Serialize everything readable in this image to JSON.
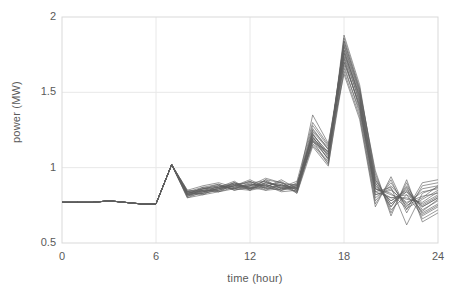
{
  "chart_data": {
    "type": "line",
    "title": "",
    "subtitle": "",
    "xlabel": "time (hour)",
    "ylabel": "power (MW)",
    "xlim": [
      0,
      24
    ],
    "ylim": [
      0.5,
      2
    ],
    "xticks": [
      "0",
      "6",
      "12",
      "18",
      "24"
    ],
    "xtick_values": [
      0,
      6,
      12,
      18,
      24
    ],
    "yticks": [
      "0.5",
      "1",
      "1.5",
      "2"
    ],
    "ytick_values": [
      0.5,
      1,
      1.5,
      2
    ],
    "grid": true,
    "grid_color": "#e8e8e8",
    "frame_color": "#d9d9d9",
    "line_color": "#5f5f5f",
    "legend": "none",
    "annotations": [],
    "x": [
      0,
      1,
      2,
      3,
      4,
      5,
      6,
      7,
      8,
      9,
      10,
      11,
      12,
      13,
      14,
      15,
      16,
      17,
      18,
      19,
      20,
      21,
      22,
      23,
      24
    ],
    "series": [
      {
        "name": "day-01",
        "values": [
          0.77,
          0.77,
          0.77,
          0.78,
          0.77,
          0.76,
          0.76,
          1.02,
          0.83,
          0.84,
          0.86,
          0.88,
          0.87,
          0.9,
          0.88,
          0.86,
          1.2,
          1.09,
          1.82,
          1.5,
          0.88,
          0.78,
          0.84,
          0.74,
          0.8
        ]
      },
      {
        "name": "day-02",
        "values": [
          0.77,
          0.77,
          0.77,
          0.78,
          0.77,
          0.76,
          0.76,
          1.02,
          0.82,
          0.85,
          0.87,
          0.89,
          0.85,
          0.92,
          0.86,
          0.87,
          1.22,
          1.1,
          1.78,
          1.46,
          0.86,
          0.82,
          0.79,
          0.77,
          0.84
        ]
      },
      {
        "name": "day-03",
        "values": [
          0.77,
          0.77,
          0.77,
          0.78,
          0.77,
          0.76,
          0.76,
          1.02,
          0.84,
          0.86,
          0.88,
          0.86,
          0.89,
          0.88,
          0.9,
          0.85,
          1.18,
          1.06,
          1.88,
          1.55,
          0.92,
          0.76,
          0.86,
          0.7,
          0.76
        ]
      },
      {
        "name": "day-04",
        "values": [
          0.77,
          0.77,
          0.77,
          0.78,
          0.77,
          0.76,
          0.76,
          1.02,
          0.81,
          0.83,
          0.85,
          0.9,
          0.86,
          0.89,
          0.85,
          0.88,
          1.24,
          1.12,
          1.7,
          1.42,
          0.82,
          0.86,
          0.75,
          0.8,
          0.88
        ]
      },
      {
        "name": "day-05",
        "values": [
          0.77,
          0.77,
          0.77,
          0.78,
          0.77,
          0.76,
          0.76,
          1.02,
          0.83,
          0.85,
          0.84,
          0.87,
          0.91,
          0.86,
          0.89,
          0.84,
          1.16,
          1.04,
          1.76,
          1.48,
          0.9,
          0.74,
          0.88,
          0.72,
          0.78
        ]
      },
      {
        "name": "day-06",
        "values": [
          0.77,
          0.77,
          0.77,
          0.78,
          0.77,
          0.76,
          0.76,
          1.02,
          0.82,
          0.84,
          0.86,
          0.88,
          0.88,
          0.91,
          0.87,
          0.86,
          1.35,
          1.16,
          1.74,
          1.44,
          0.84,
          0.8,
          0.8,
          0.76,
          0.82
        ]
      },
      {
        "name": "day-07",
        "values": [
          0.77,
          0.77,
          0.77,
          0.78,
          0.77,
          0.76,
          0.76,
          1.02,
          0.84,
          0.87,
          0.89,
          0.85,
          0.87,
          0.87,
          0.91,
          0.83,
          1.19,
          1.08,
          1.84,
          1.52,
          0.94,
          0.72,
          0.82,
          0.68,
          0.74
        ]
      },
      {
        "name": "day-08",
        "values": [
          0.77,
          0.77,
          0.77,
          0.78,
          0.77,
          0.76,
          0.76,
          1.02,
          0.8,
          0.82,
          0.84,
          0.89,
          0.9,
          0.85,
          0.86,
          0.89,
          1.21,
          1.05,
          1.66,
          1.38,
          0.8,
          0.88,
          0.76,
          0.84,
          0.86
        ]
      },
      {
        "name": "day-09",
        "values": [
          0.77,
          0.77,
          0.77,
          0.78,
          0.77,
          0.76,
          0.76,
          1.02,
          0.83,
          0.86,
          0.87,
          0.86,
          0.85,
          0.9,
          0.88,
          0.87,
          1.17,
          1.11,
          1.8,
          1.47,
          0.88,
          0.78,
          0.85,
          0.74,
          0.8
        ]
      },
      {
        "name": "day-10",
        "values": [
          0.77,
          0.77,
          0.77,
          0.78,
          0.77,
          0.76,
          0.76,
          1.02,
          0.82,
          0.83,
          0.88,
          0.87,
          0.89,
          0.88,
          0.84,
          0.85,
          1.23,
          1.07,
          1.72,
          1.4,
          0.86,
          0.83,
          0.73,
          0.79,
          0.85
        ]
      },
      {
        "name": "day-11",
        "values": [
          0.77,
          0.77,
          0.77,
          0.78,
          0.77,
          0.76,
          0.76,
          1.02,
          0.85,
          0.84,
          0.86,
          0.9,
          0.86,
          0.92,
          0.9,
          0.88,
          1.15,
          1.03,
          1.86,
          1.53,
          0.96,
          0.7,
          0.9,
          0.66,
          0.72
        ]
      },
      {
        "name": "day-12",
        "values": [
          0.77,
          0.77,
          0.77,
          0.78,
          0.77,
          0.76,
          0.76,
          1.02,
          0.81,
          0.85,
          0.85,
          0.88,
          0.91,
          0.86,
          0.87,
          0.84,
          1.25,
          1.13,
          1.68,
          1.36,
          0.78,
          0.9,
          0.74,
          0.86,
          0.88
        ]
      },
      {
        "name": "day-13",
        "values": [
          0.77,
          0.77,
          0.77,
          0.78,
          0.77,
          0.76,
          0.76,
          1.02,
          0.83,
          0.86,
          0.89,
          0.85,
          0.88,
          0.89,
          0.85,
          0.9,
          1.2,
          1.09,
          1.78,
          1.45,
          0.9,
          0.76,
          0.84,
          0.71,
          0.79
        ]
      },
      {
        "name": "day-14",
        "values": [
          0.77,
          0.77,
          0.77,
          0.78,
          0.77,
          0.76,
          0.76,
          1.02,
          0.84,
          0.82,
          0.87,
          0.91,
          0.85,
          0.87,
          0.92,
          0.86,
          1.18,
          1.02,
          1.64,
          1.34,
          0.76,
          0.92,
          0.7,
          0.88,
          0.9
        ]
      },
      {
        "name": "day-15",
        "values": [
          0.77,
          0.77,
          0.77,
          0.78,
          0.77,
          0.76,
          0.76,
          1.02,
          0.82,
          0.87,
          0.84,
          0.86,
          0.9,
          0.91,
          0.86,
          0.88,
          1.28,
          1.14,
          1.81,
          1.49,
          0.92,
          0.74,
          0.87,
          0.69,
          0.75
        ]
      },
      {
        "name": "day-16",
        "values": [
          0.77,
          0.77,
          0.77,
          0.78,
          0.77,
          0.76,
          0.76,
          1.02,
          0.8,
          0.84,
          0.86,
          0.89,
          0.87,
          0.85,
          0.89,
          0.83,
          1.14,
          1.01,
          1.7,
          1.41,
          0.82,
          0.85,
          0.77,
          0.81,
          0.83
        ]
      },
      {
        "name": "day-17",
        "values": [
          0.77,
          0.77,
          0.77,
          0.78,
          0.77,
          0.76,
          0.76,
          1.02,
          0.85,
          0.88,
          0.9,
          0.87,
          0.86,
          0.9,
          0.88,
          0.89,
          1.22,
          1.1,
          1.84,
          1.51,
          0.98,
          0.68,
          0.92,
          0.64,
          0.7
        ]
      },
      {
        "name": "day-18",
        "values": [
          0.77,
          0.77,
          0.77,
          0.78,
          0.77,
          0.76,
          0.76,
          1.02,
          0.83,
          0.83,
          0.85,
          0.88,
          0.92,
          0.87,
          0.85,
          0.87,
          1.26,
          1.12,
          1.62,
          1.32,
          0.74,
          0.94,
          0.72,
          0.9,
          0.92
        ]
      },
      {
        "name": "day-19",
        "values": [
          0.77,
          0.77,
          0.77,
          0.78,
          0.77,
          0.76,
          0.76,
          1.02,
          0.81,
          0.86,
          0.88,
          0.86,
          0.88,
          0.93,
          0.9,
          0.85,
          1.19,
          1.06,
          1.76,
          1.43,
          0.86,
          0.8,
          0.82,
          0.75,
          0.81
        ]
      },
      {
        "name": "day-20",
        "values": [
          0.77,
          0.77,
          0.77,
          0.78,
          0.77,
          0.76,
          0.76,
          1.02,
          0.84,
          0.85,
          0.87,
          0.9,
          0.86,
          0.88,
          0.87,
          0.91,
          1.3,
          1.15,
          1.73,
          1.39,
          0.84,
          0.87,
          0.62,
          0.83,
          0.87
        ]
      }
    ]
  }
}
